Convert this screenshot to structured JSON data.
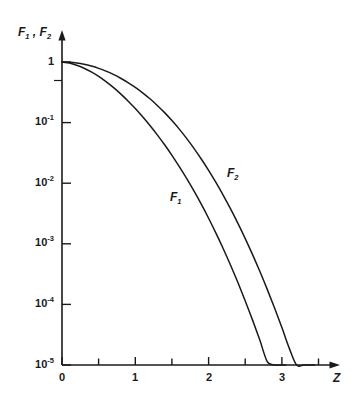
{
  "figure": {
    "background": "#ffffff",
    "ink_color": "#1a1a1a"
  },
  "axes": {
    "y_axis_title": "F₁ , F₂",
    "y_axis_title_parts": {
      "f1": "F",
      "f1_sub": "1",
      "sep": " , ",
      "f2": "F",
      "f2_sub": "2"
    },
    "x_axis_title": "Z",
    "y_tick_labels": [
      "1",
      "10⁻¹",
      "10⁻²",
      "10⁻³",
      "10⁻⁴",
      "10⁻⁵"
    ],
    "y_tick_mantissa": [
      "1",
      "10",
      "10",
      "10",
      "10",
      "10"
    ],
    "y_tick_exponent": [
      "",
      "-1",
      "-2",
      "-3",
      "-4",
      "-5"
    ],
    "x_tick_labels": [
      "0",
      "1",
      "2",
      "3"
    ]
  },
  "curve_labels": {
    "f1": "F",
    "f1_sub": "1",
    "f2": "F",
    "f2_sub": "2"
  },
  "chart_data": {
    "type": "line",
    "title": "",
    "subtitle": "",
    "xlabel": "Z",
    "ylabel": "F₁ , F₂",
    "yscale": "log",
    "xscale": "linear",
    "xlim": [
      0,
      3.6
    ],
    "ylim": [
      1e-05,
      1
    ],
    "xticks": [
      0,
      1,
      2,
      3
    ],
    "xticks_minor": [
      0.5,
      1.5,
      2.5,
      3.5
    ],
    "yticks": [
      1,
      0.1,
      0.01,
      0.001,
      0.0001,
      1e-05
    ],
    "yticks_minor": [
      0.5
    ],
    "grid": false,
    "legend": "inline-annotations",
    "annotations": [
      {
        "text": "F₁",
        "x": 1.55,
        "y": 0.0055
      },
      {
        "text": "F₂",
        "x": 2.33,
        "y": 0.019
      }
    ],
    "series": [
      {
        "name": "F₁",
        "x": [
          0.0,
          0.1,
          0.2,
          0.3,
          0.4,
          0.5,
          0.6,
          0.7,
          0.8,
          0.9,
          1.0,
          1.1,
          1.2,
          1.3,
          1.4,
          1.5,
          1.6,
          1.7,
          1.8,
          1.9,
          2.0,
          2.1,
          2.2,
          2.3,
          2.4,
          2.5,
          2.6,
          2.7,
          2.8,
          2.9,
          3.0,
          3.05
        ],
        "y": [
          1.0,
          0.96,
          0.885,
          0.79,
          0.685,
          0.578,
          0.475,
          0.381,
          0.298,
          0.228,
          0.171,
          0.125,
          0.0896,
          0.0628,
          0.043,
          0.0288,
          0.0188,
          0.012,
          0.00745,
          0.0045,
          0.00264,
          0.0015,
          0.00083,
          0.000443,
          0.000229,
          0.000114,
          5.5e-05,
          2.55e-05,
          1.14e-05,
          4.9e-06,
          2e-06,
          1e-05
        ]
      },
      {
        "name": "F₂",
        "x": [
          0.0,
          0.1,
          0.2,
          0.3,
          0.4,
          0.5,
          0.6,
          0.7,
          0.8,
          0.9,
          1.0,
          1.1,
          1.2,
          1.3,
          1.4,
          1.5,
          1.6,
          1.7,
          1.8,
          1.9,
          2.0,
          2.1,
          2.2,
          2.3,
          2.4,
          2.5,
          2.6,
          2.7,
          2.8,
          2.9,
          3.0,
          3.1,
          3.2,
          3.3,
          3.4,
          3.45
        ],
        "y": [
          1.0,
          0.99,
          0.962,
          0.917,
          0.857,
          0.786,
          0.707,
          0.624,
          0.54,
          0.458,
          0.381,
          0.31,
          0.247,
          0.192,
          0.146,
          0.108,
          0.0781,
          0.0549,
          0.0376,
          0.0251,
          0.0163,
          0.0103,
          0.00632,
          0.00376,
          0.00217,
          0.00122,
          0.000662,
          0.000348,
          0.000177,
          8.7e-05,
          4.14e-05,
          1.9e-05,
          8.4e-06,
          3.6e-06,
          1.5e-06,
          1e-05
        ]
      }
    ]
  }
}
